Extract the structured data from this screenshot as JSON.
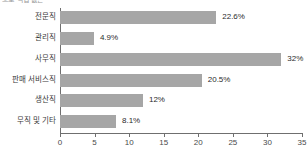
{
  "chart_data": {
    "type": "bar",
    "orientation": "horizontal",
    "title": "으로 직업 없는",
    "categories": [
      "전문직",
      "관리직",
      "사무직",
      "판매 서비스직",
      "생산직",
      "무직 및 기타"
    ],
    "values": [
      22.6,
      4.9,
      32,
      20.5,
      12,
      8.1
    ],
    "value_labels": [
      "22.6%",
      "4.9%",
      "32%",
      "20.5%",
      "12%",
      "8.1%"
    ],
    "xlabel": "",
    "ylabel": "",
    "xlim": [
      0,
      35
    ],
    "xticks": [
      0,
      5,
      10,
      15,
      20,
      25,
      30,
      35
    ],
    "xtick_labels": [
      "0",
      "5",
      "10",
      "15",
      "20",
      "25",
      "30",
      "35"
    ],
    "grid": false,
    "legend": null,
    "bar_color": "#a6a6a6",
    "axis_color": "#6f6f6f",
    "text_color": "#2b2b2b"
  }
}
